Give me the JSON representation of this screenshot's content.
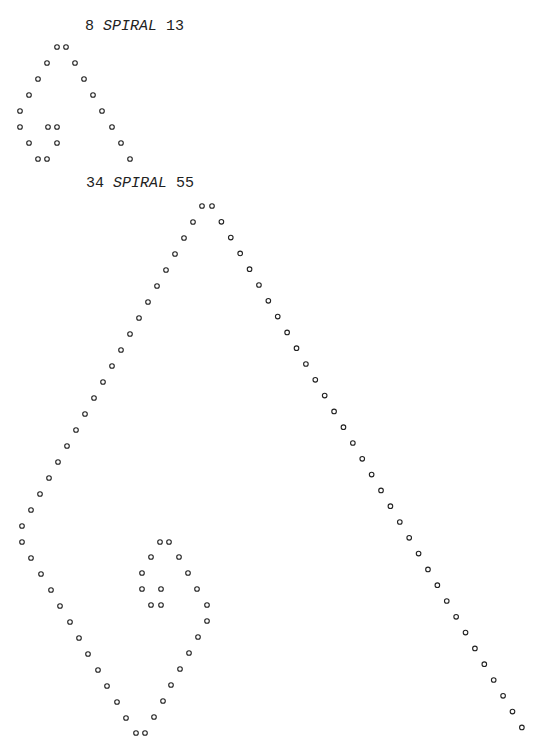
{
  "figures": [
    {
      "heading": {
        "left_number": "8",
        "title": "SPIRAL",
        "right_number": "13"
      },
      "marker": "o",
      "dots": [
        [
          57,
          47
        ],
        [
          66,
          47
        ],
        [
          47,
          63
        ],
        [
          75,
          63
        ],
        [
          38,
          79
        ],
        [
          84,
          79
        ],
        [
          29,
          95
        ],
        [
          93,
          95
        ],
        [
          20,
          111
        ],
        [
          102,
          111
        ],
        [
          20,
          127
        ],
        [
          48,
          127
        ],
        [
          57,
          127
        ],
        [
          112,
          127
        ],
        [
          29,
          143
        ],
        [
          57,
          143
        ],
        [
          121,
          143
        ],
        [
          38,
          159
        ],
        [
          47,
          159
        ],
        [
          130,
          159
        ]
      ]
    },
    {
      "heading": {
        "left_number": "34",
        "title": "SPIRAL",
        "right_number": "55"
      },
      "marker": "o",
      "right_diagonal": {
        "start": [
          212,
          206
        ],
        "step": [
          9.39,
          15.8
        ],
        "count": 34
      },
      "left_diagonal": {
        "start": [
          202,
          206
        ],
        "step": [
          -9,
          16
        ],
        "count": 21
      },
      "dots": [
        [
          22,
          542
        ],
        [
          31,
          558
        ],
        [
          41,
          574
        ],
        [
          51,
          590
        ],
        [
          60,
          606
        ],
        [
          70,
          622
        ],
        [
          79,
          638
        ],
        [
          88,
          654
        ],
        [
          98,
          670
        ],
        [
          107,
          686
        ],
        [
          117,
          702
        ],
        [
          126,
          718
        ],
        [
          136,
          733
        ],
        [
          145,
          733
        ],
        [
          154,
          717
        ],
        [
          163,
          701
        ],
        [
          171,
          685
        ],
        [
          180,
          669
        ],
        [
          189,
          653
        ],
        [
          198,
          637
        ],
        [
          207,
          621
        ],
        [
          207,
          605
        ],
        [
          197,
          589
        ],
        [
          188,
          573
        ],
        [
          179,
          557
        ],
        [
          169,
          542
        ],
        [
          160,
          542
        ],
        [
          151,
          557
        ],
        [
          142,
          573
        ],
        [
          142,
          589
        ],
        [
          151,
          605
        ],
        [
          161,
          605
        ],
        [
          161,
          589
        ]
      ]
    }
  ],
  "style": {
    "ink": "#222222",
    "background": "#ffffff",
    "dot_radius": 2.3
  }
}
